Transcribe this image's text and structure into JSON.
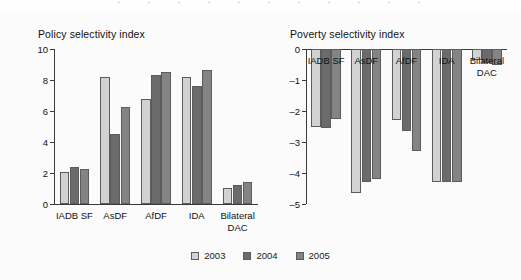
{
  "legend": {
    "items": [
      {
        "label": "2003",
        "color": "#d2d2d2"
      },
      {
        "label": "2004",
        "color": "#6b6b6b"
      },
      {
        "label": "2005",
        "color": "#848484"
      }
    ]
  },
  "chart_data": [
    {
      "type": "bar",
      "title": "Policy selectivity index",
      "xlabel": "",
      "ylabel": "",
      "ylim": [
        0,
        10
      ],
      "yticks": [
        0,
        2,
        4,
        6,
        8,
        10
      ],
      "ytick_labels": [
        "0",
        "2",
        "4",
        "6",
        "8",
        "10"
      ],
      "grid": false,
      "legend_position": "bottom-center",
      "categories": [
        "IADB SF",
        "AsDF",
        "AfDF",
        "IDA",
        "Bilateral DAC"
      ],
      "series": [
        {
          "name": "2003",
          "values": [
            2.05,
            8.2,
            6.8,
            8.2,
            1.05
          ]
        },
        {
          "name": "2004",
          "values": [
            2.4,
            4.5,
            8.3,
            7.6,
            1.25
          ]
        },
        {
          "name": "2005",
          "values": [
            2.25,
            6.25,
            8.5,
            8.65,
            1.45
          ]
        }
      ]
    },
    {
      "type": "bar",
      "title": "Poverty selectivity index",
      "xlabel": "",
      "ylabel": "",
      "ylim": [
        -5,
        0
      ],
      "yticks": [
        0,
        -1,
        -2,
        -3,
        -4,
        -5
      ],
      "ytick_labels": [
        "0",
        "–1",
        "–2",
        "–3",
        "–4",
        "–5"
      ],
      "grid": false,
      "legend_position": "bottom-center",
      "categories": [
        "IADB SF",
        "AsDF",
        "AfDF",
        "IDA",
        "Bilateral DAC"
      ],
      "series": [
        {
          "name": "2003",
          "values": [
            -2.5,
            -4.65,
            -2.3,
            -4.3,
            -0.35
          ]
        },
        {
          "name": "2004",
          "values": [
            -2.55,
            -4.3,
            -2.65,
            -4.3,
            -0.45
          ]
        },
        {
          "name": "2005",
          "values": [
            -2.25,
            -4.2,
            -3.3,
            -4.3,
            -0.5
          ]
        }
      ]
    }
  ]
}
